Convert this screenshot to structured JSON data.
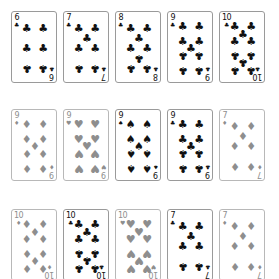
{
  "colors": {
    "card_border": "#9a9a9a",
    "active_ink": "#111111",
    "dimmed_ink": "#8e8e8e",
    "background": "#ffffff"
  },
  "suits": {
    "clubs": "♣",
    "spades": "♠",
    "hearts": "♥",
    "diamonds": "♦"
  },
  "rows": [
    {
      "cards": [
        {
          "rank": "6",
          "suit": "clubs",
          "dimmed": false
        },
        {
          "rank": "7",
          "suit": "clubs",
          "dimmed": false
        },
        {
          "rank": "8",
          "suit": "clubs",
          "dimmed": false
        },
        {
          "rank": "9",
          "suit": "clubs",
          "dimmed": false
        },
        {
          "rank": "10",
          "suit": "clubs",
          "dimmed": false
        }
      ]
    },
    {
      "cards": [
        {
          "rank": "9",
          "suit": "diamonds",
          "dimmed": true
        },
        {
          "rank": "9",
          "suit": "hearts",
          "dimmed": true
        },
        {
          "rank": "9",
          "suit": "spades",
          "dimmed": false
        },
        {
          "rank": "9",
          "suit": "clubs",
          "dimmed": false
        },
        {
          "rank": "7",
          "suit": "diamonds",
          "dimmed": true
        }
      ]
    },
    {
      "cards": [
        {
          "rank": "10",
          "suit": "diamonds",
          "dimmed": true
        },
        {
          "rank": "10",
          "suit": "clubs",
          "dimmed": false
        },
        {
          "rank": "10",
          "suit": "hearts",
          "dimmed": true
        },
        {
          "rank": "7",
          "suit": "clubs",
          "dimmed": false
        },
        {
          "rank": "7",
          "suit": "diamonds",
          "dimmed": true
        }
      ]
    }
  ]
}
